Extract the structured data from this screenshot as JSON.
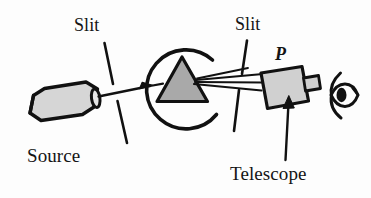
{
  "figure": {
    "background_color": "#fdfdfd",
    "ink_color": "#111111",
    "labels": {
      "slit_left": "Slit",
      "slit_right": "Slit",
      "prism_marker": "P",
      "source": "Source",
      "telescope": "Telescope"
    },
    "parts": {
      "source": {
        "name": "source-lamp",
        "shape": "cylinder",
        "fill_color": "#d6d6d6"
      },
      "collimator_slit": {
        "name": "slit-left",
        "shape": "broken-line",
        "color": "#111111"
      },
      "prism_table": {
        "name": "rotating-table",
        "shape": "open-circle-arc",
        "color": "#111111"
      },
      "prism": {
        "name": "prism",
        "shape": "triangle",
        "fill_color": "#a9a9a9"
      },
      "telescope_slit": {
        "name": "slit-right",
        "shape": "broken-line",
        "color": "#111111"
      },
      "telescope": {
        "name": "telescope",
        "shape": "box-with-eyepiece",
        "fill_color": "#d0d0d0"
      },
      "eye": {
        "name": "observer-eye",
        "shape": "almond-with-pupil",
        "color": "#111111"
      },
      "incident_ray": {
        "name": "incident-ray",
        "arrowhead": true
      },
      "refracted_rays": {
        "name": "refracted-ray-fan",
        "count": 3
      }
    }
  }
}
